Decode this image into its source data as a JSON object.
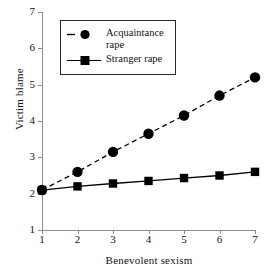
{
  "chart_data": {
    "type": "line",
    "title": "",
    "xlabel": "Benevolent sexism",
    "ylabel": "Victim blame",
    "x": [
      1,
      2,
      3,
      4,
      5,
      6,
      7
    ],
    "xticklabels": [
      "1",
      "2",
      "3",
      "4",
      "5",
      "6",
      "7"
    ],
    "yticklabels": [
      "1",
      "2",
      "3",
      "4",
      "5",
      "6",
      "7"
    ],
    "xlim": [
      1,
      7
    ],
    "ylim": [
      1,
      7
    ],
    "grid": false,
    "legend_position": "upper left",
    "series": [
      {
        "name": "Acquaintance rape",
        "legend_label_line1": "Acquaintance",
        "legend_label_line2": "rape",
        "marker": "circle",
        "linestyle": "dashed",
        "color": "#000000",
        "values": [
          2.1,
          2.6,
          3.15,
          3.65,
          4.15,
          4.7,
          5.2
        ]
      },
      {
        "name": "Stranger rape",
        "legend_label_line1": "Stranger rape",
        "legend_label_line2": "",
        "marker": "square",
        "linestyle": "solid",
        "color": "#000000",
        "values": [
          2.1,
          2.2,
          2.28,
          2.35,
          2.43,
          2.5,
          2.6
        ]
      }
    ]
  },
  "axes": {
    "x_title": "Benevolent sexism",
    "y_title": "Victim blame",
    "x_ticks": [
      "1",
      "2",
      "3",
      "4",
      "5",
      "6",
      "7"
    ],
    "y_ticks": [
      "1",
      "2",
      "3",
      "4",
      "5",
      "6",
      "7"
    ],
    "spine_color": "#8d8d8d"
  },
  "legend": {
    "items": [
      {
        "label_line1": "Acquaintance",
        "label_line2": "rape",
        "marker": "circle",
        "linestyle": "dashed"
      },
      {
        "label_line1": "Stranger rape",
        "label_line2": "",
        "marker": "square",
        "linestyle": "solid"
      }
    ],
    "border_color": "#2b2b2b"
  }
}
